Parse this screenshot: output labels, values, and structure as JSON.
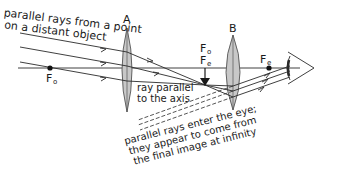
{
  "diagram": {
    "labels": {
      "top_left_line1": "parallel rays from a point",
      "top_left_line2": "on a distant object",
      "lens_a": "A",
      "lens_b": "B",
      "focus_objective_main": "F",
      "focus_objective_sub": "o",
      "focus_image_fo_main": "F",
      "focus_image_fo_sub": "o",
      "focus_image_fe_main": "F",
      "focus_image_fe_sub": "e",
      "focus_eyepiece_main": "F",
      "focus_eyepiece_sub": "e",
      "ray_parallel_line1": "ray parallel",
      "ray_parallel_line2": "to the axis",
      "bottom_line1": "parallel rays enter the eye;",
      "bottom_line2": "they appear to come from",
      "bottom_line3": "the final image at infinity"
    },
    "elements": {
      "lens_a": "objective lens (converging)",
      "lens_b": "eyepiece lens (converging)",
      "eye": "eye-icon",
      "image_arrow": "intermediate image arrow"
    },
    "colors": {
      "line": "#2a2a2a",
      "lens_fill": "#c8c8c8",
      "lens_stroke": "#555555",
      "background": "#ffffff"
    }
  }
}
